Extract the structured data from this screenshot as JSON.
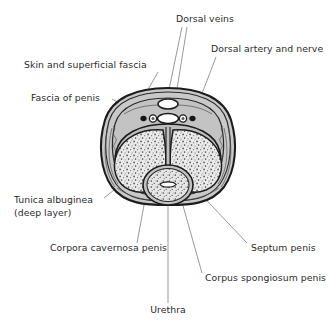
{
  "figure": {
    "type": "anatomical-cross-section",
    "background_color": "#ffffff",
    "line_color": "#1c1c1c",
    "leader_color": "#6d6d6d",
    "text_color": "#2b2b2b",
    "fill_colors": {
      "fascia_gray": "#c8c8c8",
      "tunica_gray": "#bdbdbd",
      "cavernous_tissue": "#e3e3e3",
      "vessel_lumen": "#ffffff",
      "vessel_dark": "#1c1c1c"
    }
  },
  "labels": [
    {
      "id": "dorsal-veins",
      "text": "Dorsal veins",
      "x": 176,
      "y": 22,
      "anchor": "start"
    },
    {
      "id": "dorsal-artery-and-nerve",
      "text": "Dorsal artery and nerve",
      "x": 211,
      "y": 52,
      "anchor": "start"
    },
    {
      "id": "skin-and-superficial-fascia",
      "text": "Skin and superficial fascia",
      "x": 24,
      "y": 68,
      "anchor": "start"
    },
    {
      "id": "fascia-of-penis",
      "text": "Fascia of penis",
      "x": 31,
      "y": 101,
      "anchor": "start"
    },
    {
      "id": "tunica-albuginea",
      "text": "Tunica albuginea",
      "x": 14,
      "y": 203,
      "anchor": "start"
    },
    {
      "id": "tunica-albuginea-deep-layer",
      "text": "(deep layer)",
      "x": 14,
      "y": 216,
      "anchor": "start"
    },
    {
      "id": "corpora-cavernosa-penis",
      "text": "Corpora cavernosa penis",
      "x": 50,
      "y": 251,
      "anchor": "start"
    },
    {
      "id": "septum-penis",
      "text": "Septum penis",
      "x": 251,
      "y": 251,
      "anchor": "start"
    },
    {
      "id": "corpus-spongiosum-penis",
      "text": "Corpus spongiosum penis",
      "x": 205,
      "y": 281,
      "anchor": "start"
    },
    {
      "id": "urethra",
      "text": "Urethra",
      "x": 168,
      "y": 313,
      "anchor": "middle"
    }
  ],
  "structures": [
    {
      "id": "skin-superficial-fascia",
      "name": "Skin and superficial fascia"
    },
    {
      "id": "fascia-of-penis",
      "name": "Fascia of penis"
    },
    {
      "id": "tunica-albuginea-deep",
      "name": "Tunica albuginea (deep layer)"
    },
    {
      "id": "corpus-cavernosum-left",
      "name": "Corpus cavernosum penis (left)"
    },
    {
      "id": "corpus-cavernosum-right",
      "name": "Corpus cavernosum penis (right)"
    },
    {
      "id": "septum-penis",
      "name": "Septum penis"
    },
    {
      "id": "corpus-spongiosum",
      "name": "Corpus spongiosum penis"
    },
    {
      "id": "urethra",
      "name": "Urethra"
    },
    {
      "id": "superficial-dorsal-vein",
      "name": "Superficial dorsal vein"
    },
    {
      "id": "deep-dorsal-vein",
      "name": "Deep dorsal vein"
    },
    {
      "id": "dorsal-artery-left",
      "name": "Dorsal artery (left)"
    },
    {
      "id": "dorsal-artery-right",
      "name": "Dorsal artery (right)"
    },
    {
      "id": "dorsal-nerve-left",
      "name": "Dorsal nerve (left)"
    },
    {
      "id": "dorsal-nerve-right",
      "name": "Dorsal nerve (right)"
    }
  ]
}
